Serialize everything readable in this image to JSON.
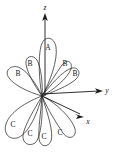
{
  "figure": {
    "name": "three-dimensional-radiation-lobe-diagram",
    "background_color": "#ffffff",
    "stroke_color": "#2b2b2b",
    "label_color": "#111111",
    "origin": {
      "x": 42,
      "y": 96
    }
  },
  "axes": [
    {
      "id": "z",
      "label": "z",
      "label_x": 45,
      "label_y": 8,
      "direction": "up"
    },
    {
      "id": "y",
      "label": "y",
      "label_x": 107,
      "label_y": 91,
      "direction": "right"
    },
    {
      "id": "x",
      "label": "x",
      "label_x": 88,
      "label_y": 122,
      "direction": "down-right"
    }
  ],
  "lobes": [
    {
      "group": "A",
      "label": "A",
      "label_x": 48,
      "label_y": 48,
      "orientation": "vertical-up"
    },
    {
      "group": "B",
      "label": "B",
      "label_x": 30,
      "label_y": 64,
      "orientation": "upper-left-diagonal"
    },
    {
      "group": "B",
      "label": "B",
      "label_x": 18,
      "label_y": 74,
      "orientation": "left"
    },
    {
      "group": "B",
      "label": "B",
      "label_x": 65,
      "label_y": 64,
      "orientation": "upper-right-diagonal"
    },
    {
      "group": "B",
      "label": "B",
      "label_x": 75,
      "label_y": 74,
      "orientation": "right"
    },
    {
      "group": "C",
      "label": "C",
      "label_x": 13,
      "label_y": 125,
      "orientation": "lower-left"
    },
    {
      "group": "C",
      "label": "C",
      "label_x": 30,
      "label_y": 134,
      "orientation": "lower-left-inner"
    },
    {
      "group": "C",
      "label": "C",
      "label_x": 44,
      "label_y": 137,
      "orientation": "down"
    },
    {
      "group": "C",
      "label": "C",
      "label_x": 60,
      "label_y": 133,
      "orientation": "lower-right"
    }
  ],
  "groups": {
    "A": "A",
    "B": "B",
    "C": "C"
  }
}
